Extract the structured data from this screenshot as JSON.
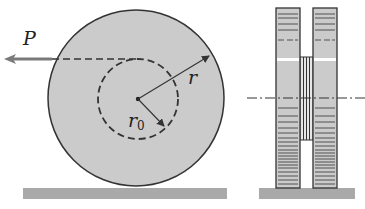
{
  "figure": {
    "front_view": {
      "force_label": "P",
      "outer_radius_label": "r",
      "inner_radius_label": "r",
      "inner_radius_subscript": "0"
    },
    "side_view": {}
  },
  "colors": {
    "disk_fill": "#cbcbcb",
    "ground_fill": "#a9a9a9",
    "stroke": "#333333",
    "arrow": "#7a7a7a"
  }
}
